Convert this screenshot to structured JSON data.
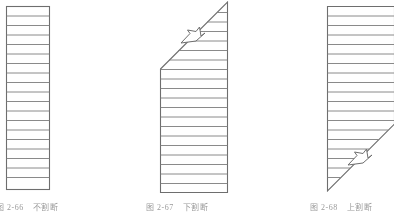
{
  "page": {
    "width": 394,
    "height": 212,
    "background": "#ffffff",
    "line_color": "#6e6e6e",
    "line_color_light": "#8d8d8d",
    "caption_color": "#5a5a5a"
  },
  "figures": [
    {
      "id": "figure-left",
      "name": "no-break-rectangle",
      "caption_number": "图 2-66",
      "caption_label": "不割断",
      "shape": "rectangle",
      "bounds": {
        "x": 6,
        "y": 6,
        "width": 44,
        "height": 184
      },
      "hatch_lines": 19,
      "break_symbol": "none"
    },
    {
      "id": "figure-middle",
      "name": "lower-break-trapezoid",
      "caption_number": "图 2-67",
      "caption_label": "下割断",
      "shape": "trapezoid-upper-diagonal",
      "bounds": {
        "x": 160,
        "y": 2,
        "width": 68,
        "height": 191
      },
      "diagonal": {
        "x1": 160,
        "y1": 69,
        "x2": 228,
        "y2": 2
      },
      "hatch_lines": 18,
      "break_symbol": "zigzag",
      "break_symbol_position": {
        "x": 193,
        "y": 36
      }
    },
    {
      "id": "figure-right",
      "name": "upper-break-trapezoid",
      "caption_number": "图 2-68",
      "caption_label": "上割断",
      "shape": "trapezoid-lower-diagonal",
      "bounds": {
        "x": 327,
        "y": 6,
        "width": 67,
        "height": 185
      },
      "diagonal": {
        "x1": 327,
        "y1": 191,
        "x2": 394,
        "y2": 124
      },
      "hatch_lines": 17,
      "break_symbol": "zigzag",
      "break_symbol_position": {
        "x": 360,
        "y": 158
      }
    }
  ]
}
